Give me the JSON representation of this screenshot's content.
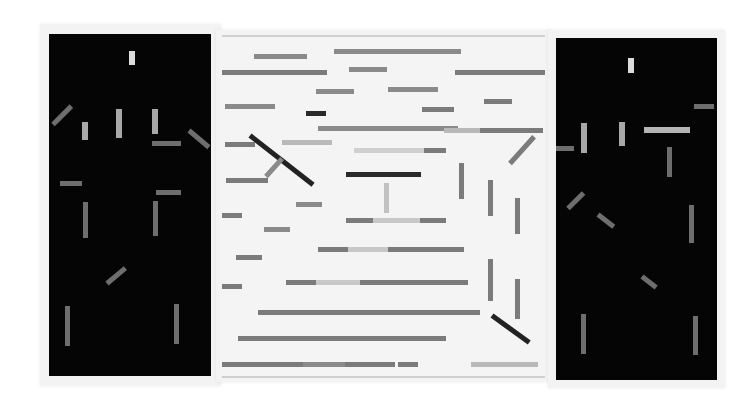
{
  "artwork": {
    "description": "Photograph of an abstract triptych: two black side panels and a white center panel with grey horizontal, vertical and diagonal bars forming a perspective box",
    "colors": {
      "background": "#ffffff",
      "mat": "#f3f3f3",
      "black_panel": "#050505",
      "white_panel": "#f4f4f4",
      "bar_mid_grey": "#7b7b7b",
      "bar_light_grey": "#b9b9b9",
      "bar_pale": "#cfcfcf",
      "bar_dark": "#2a2a2a"
    },
    "panels": [
      {
        "id": "left",
        "type": "black",
        "mat": {
          "x": 40,
          "y": 24,
          "w": 181,
          "h": 362
        },
        "rect": {
          "x": 49,
          "y": 34,
          "w": 162,
          "h": 342
        },
        "bars": [
          {
            "x": 80,
            "y": 17,
            "w": 6,
            "h": 14,
            "a": 0,
            "c": "#dcdcdc"
          },
          {
            "x": 4,
            "y": 88,
            "w": 26,
            "h": 5,
            "a": -45,
            "c": "#6e6e6e"
          },
          {
            "x": 33,
            "y": 88,
            "w": 6,
            "h": 18,
            "a": 0,
            "c": "#a8a8a8"
          },
          {
            "x": 67,
            "y": 75,
            "w": 6,
            "h": 29,
            "a": 0,
            "c": "#a8a8a8"
          },
          {
            "x": 103,
            "y": 75,
            "w": 6,
            "h": 25,
            "a": 0,
            "c": "#a8a8a8"
          },
          {
            "x": 140,
            "y": 94,
            "w": 26,
            "h": 5,
            "a": 40,
            "c": "#6e6e6e"
          },
          {
            "x": 103,
            "y": 107,
            "w": 29,
            "h": 5,
            "a": 0,
            "c": "#6e6e6e"
          },
          {
            "x": 11,
            "y": 147,
            "w": 22,
            "h": 5,
            "a": 0,
            "c": "#6e6e6e"
          },
          {
            "x": 107,
            "y": 156,
            "w": 25,
            "h": 5,
            "a": 0,
            "c": "#6e6e6e"
          },
          {
            "x": 34,
            "y": 168,
            "w": 5,
            "h": 36,
            "a": 0,
            "c": "#6e6e6e"
          },
          {
            "x": 104,
            "y": 167,
            "w": 5,
            "h": 35,
            "a": 0,
            "c": "#6e6e6e"
          },
          {
            "x": 58,
            "y": 247,
            "w": 24,
            "h": 5,
            "a": -40,
            "c": "#6e6e6e"
          },
          {
            "x": 16,
            "y": 272,
            "w": 5,
            "h": 40,
            "a": 0,
            "c": "#6e6e6e"
          },
          {
            "x": 125,
            "y": 270,
            "w": 5,
            "h": 40,
            "a": 0,
            "c": "#6e6e6e"
          }
        ]
      },
      {
        "id": "center",
        "type": "white",
        "mat": {
          "x": 216,
          "y": 30,
          "w": 336,
          "h": 352
        },
        "rect": {
          "x": 222,
          "y": 35,
          "w": 323,
          "h": 339
        },
        "bars": [
          {
            "x": 32,
            "y": 17,
            "w": 53,
            "h": 5,
            "a": 0,
            "c": "#8a8a8a"
          },
          {
            "x": 112,
            "y": 12,
            "w": 127,
            "h": 5,
            "a": 0,
            "c": "#8a8a8a"
          },
          {
            "x": 0,
            "y": 33,
            "w": 105,
            "h": 5,
            "a": 0,
            "c": "#7b7b7b"
          },
          {
            "x": 127,
            "y": 30,
            "w": 38,
            "h": 5,
            "a": 0,
            "c": "#8a8a8a"
          },
          {
            "x": 233,
            "y": 33,
            "w": 90,
            "h": 5,
            "a": 0,
            "c": "#7b7b7b"
          },
          {
            "x": 94,
            "y": 52,
            "w": 38,
            "h": 5,
            "a": 0,
            "c": "#8a8a8a"
          },
          {
            "x": 166,
            "y": 50,
            "w": 50,
            "h": 5,
            "a": 0,
            "c": "#8a8a8a"
          },
          {
            "x": 3,
            "y": 67,
            "w": 50,
            "h": 5,
            "a": 0,
            "c": "#8a8a8a"
          },
          {
            "x": 84,
            "y": 74,
            "w": 20,
            "h": 5,
            "a": 0,
            "c": "#2a2a2a"
          },
          {
            "x": 262,
            "y": 62,
            "w": 28,
            "h": 5,
            "a": 0,
            "c": "#7b7b7b"
          },
          {
            "x": 200,
            "y": 70,
            "w": 32,
            "h": 5,
            "a": 0,
            "c": "#7b7b7b"
          },
          {
            "x": 96,
            "y": 89,
            "w": 140,
            "h": 5,
            "a": 0,
            "c": "#8a8a8a"
          },
          {
            "x": 222,
            "y": 91,
            "w": 36,
            "h": 5,
            "a": 0,
            "c": "#b9b9b9"
          },
          {
            "x": 258,
            "y": 91,
            "w": 63,
            "h": 5,
            "a": 0,
            "c": "#7b7b7b"
          },
          {
            "x": 3,
            "y": 105,
            "w": 30,
            "h": 5,
            "a": 0,
            "c": "#7b7b7b"
          },
          {
            "x": 28,
            "y": 96,
            "w": 80,
            "h": 5,
            "a": 38,
            "c": "#222222"
          },
          {
            "x": 60,
            "y": 103,
            "w": 50,
            "h": 5,
            "a": 0,
            "c": "#b9b9b9"
          },
          {
            "x": 132,
            "y": 111,
            "w": 70,
            "h": 5,
            "a": 0,
            "c": "#cfcfcf"
          },
          {
            "x": 202,
            "y": 111,
            "w": 22,
            "h": 5,
            "a": 0,
            "c": "#7b7b7b"
          },
          {
            "x": 288,
            "y": 124,
            "w": 36,
            "h": 5,
            "a": -48,
            "c": "#7b7b7b"
          },
          {
            "x": 44,
            "y": 137,
            "w": 24,
            "h": 5,
            "a": -48,
            "c": "#8a8a8a"
          },
          {
            "x": 4,
            "y": 141,
            "w": 42,
            "h": 5,
            "a": 0,
            "c": "#7b7b7b"
          },
          {
            "x": 124,
            "y": 135,
            "w": 75,
            "h": 5,
            "a": 0,
            "c": "#2a2a2a"
          },
          {
            "x": 237,
            "y": 126,
            "w": 5,
            "h": 36,
            "a": 0,
            "c": "#7b7b7b"
          },
          {
            "x": 266,
            "y": 143,
            "w": 5,
            "h": 36,
            "a": 0,
            "c": "#7b7b7b"
          },
          {
            "x": 293,
            "y": 161,
            "w": 5,
            "h": 36,
            "a": 0,
            "c": "#7b7b7b"
          },
          {
            "x": 162,
            "y": 146,
            "w": 5,
            "h": 30,
            "a": 0,
            "c": "#c2c2c2"
          },
          {
            "x": 74,
            "y": 165,
            "w": 26,
            "h": 5,
            "a": 0,
            "c": "#8a8a8a"
          },
          {
            "x": 0,
            "y": 176,
            "w": 20,
            "h": 5,
            "a": 0,
            "c": "#7b7b7b"
          },
          {
            "x": 124,
            "y": 181,
            "w": 27,
            "h": 5,
            "a": 0,
            "c": "#7b7b7b"
          },
          {
            "x": 151,
            "y": 181,
            "w": 47,
            "h": 5,
            "a": 0,
            "c": "#c8c8c8"
          },
          {
            "x": 198,
            "y": 181,
            "w": 26,
            "h": 5,
            "a": 0,
            "c": "#7b7b7b"
          },
          {
            "x": 42,
            "y": 190,
            "w": 26,
            "h": 5,
            "a": 0,
            "c": "#8a8a8a"
          },
          {
            "x": 96,
            "y": 210,
            "w": 30,
            "h": 5,
            "a": 0,
            "c": "#7b7b7b"
          },
          {
            "x": 126,
            "y": 210,
            "w": 40,
            "h": 5,
            "a": 0,
            "c": "#c8c8c8"
          },
          {
            "x": 166,
            "y": 210,
            "w": 76,
            "h": 5,
            "a": 0,
            "c": "#7b7b7b"
          },
          {
            "x": 14,
            "y": 218,
            "w": 26,
            "h": 5,
            "a": 0,
            "c": "#7b7b7b"
          },
          {
            "x": 266,
            "y": 222,
            "w": 5,
            "h": 42,
            "a": 0,
            "c": "#7b7b7b"
          },
          {
            "x": 293,
            "y": 242,
            "w": 5,
            "h": 40,
            "a": 0,
            "c": "#7b7b7b"
          },
          {
            "x": 0,
            "y": 247,
            "w": 20,
            "h": 5,
            "a": 0,
            "c": "#7b7b7b"
          },
          {
            "x": 64,
            "y": 243,
            "w": 30,
            "h": 5,
            "a": 0,
            "c": "#7b7b7b"
          },
          {
            "x": 94,
            "y": 243,
            "w": 44,
            "h": 5,
            "a": 0,
            "c": "#c8c8c8"
          },
          {
            "x": 138,
            "y": 243,
            "w": 108,
            "h": 5,
            "a": 0,
            "c": "#7b7b7b"
          },
          {
            "x": 36,
            "y": 273,
            "w": 52,
            "h": 5,
            "a": 0,
            "c": "#7b7b7b"
          },
          {
            "x": 88,
            "y": 273,
            "w": 170,
            "h": 5,
            "a": 0,
            "c": "#7b7b7b"
          },
          {
            "x": 270,
            "y": 276,
            "w": 46,
            "h": 5,
            "a": 36,
            "c": "#222222"
          },
          {
            "x": 16,
            "y": 299,
            "w": 108,
            "h": 5,
            "a": 0,
            "c": "#7b7b7b"
          },
          {
            "x": 124,
            "y": 299,
            "w": 100,
            "h": 5,
            "a": 0,
            "c": "#7b7b7b"
          },
          {
            "x": 0,
            "y": 325,
            "w": 81,
            "h": 5,
            "a": 0,
            "c": "#7b7b7b"
          },
          {
            "x": 81,
            "y": 325,
            "w": 42,
            "h": 5,
            "a": 0,
            "c": "#8a8a8a"
          },
          {
            "x": 123,
            "y": 325,
            "w": 50,
            "h": 5,
            "a": 0,
            "c": "#7b7b7b"
          },
          {
            "x": 176,
            "y": 325,
            "w": 20,
            "h": 5,
            "a": 0,
            "c": "#7b7b7b"
          },
          {
            "x": 249,
            "y": 325,
            "w": 67,
            "h": 5,
            "a": 0,
            "c": "#b9b9b9"
          }
        ]
      },
      {
        "id": "right",
        "type": "black",
        "mat": {
          "x": 548,
          "y": 30,
          "w": 177,
          "h": 358
        },
        "rect": {
          "x": 556,
          "y": 38,
          "w": 161,
          "h": 342
        },
        "bars": [
          {
            "x": 72,
            "y": 20,
            "w": 6,
            "h": 15,
            "a": 0,
            "c": "#dcdcdc"
          },
          {
            "x": 138,
            "y": 66,
            "w": 20,
            "h": 5,
            "a": 0,
            "c": "#6e6e6e"
          },
          {
            "x": 25,
            "y": 85,
            "w": 6,
            "h": 30,
            "a": 0,
            "c": "#a8a8a8"
          },
          {
            "x": 63,
            "y": 84,
            "w": 6,
            "h": 24,
            "a": 0,
            "c": "#a8a8a8"
          },
          {
            "x": 88,
            "y": 89,
            "w": 46,
            "h": 6,
            "a": 0,
            "c": "#b5b5b5"
          },
          {
            "x": 0,
            "y": 108,
            "w": 18,
            "h": 5,
            "a": 0,
            "c": "#6e6e6e"
          },
          {
            "x": 111,
            "y": 109,
            "w": 5,
            "h": 30,
            "a": 0,
            "c": "#6e6e6e"
          },
          {
            "x": 12,
            "y": 168,
            "w": 22,
            "h": 5,
            "a": -45,
            "c": "#6e6e6e"
          },
          {
            "x": 42,
            "y": 174,
            "w": 20,
            "h": 5,
            "a": 38,
            "c": "#6e6e6e"
          },
          {
            "x": 133,
            "y": 167,
            "w": 5,
            "h": 38,
            "a": 0,
            "c": "#6e6e6e"
          },
          {
            "x": 86,
            "y": 236,
            "w": 18,
            "h": 5,
            "a": 38,
            "c": "#6e6e6e"
          },
          {
            "x": 25,
            "y": 276,
            "w": 5,
            "h": 40,
            "a": 0,
            "c": "#6e6e6e"
          },
          {
            "x": 137,
            "y": 278,
            "w": 5,
            "h": 39,
            "a": 0,
            "c": "#6e6e6e"
          }
        ]
      }
    ]
  }
}
